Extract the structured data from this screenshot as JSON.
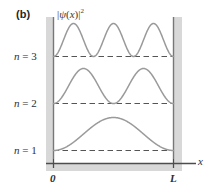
{
  "figure": {
    "panel_label": "(b)",
    "y_axis_label_parts": {
      "bar_open": "|",
      "psi": "ψ",
      "paren_open": "(",
      "var": "x",
      "paren_close": ")",
      "bar_close": "|",
      "exponent": "2"
    },
    "y_axis_label_text": "|ψ(x)|²",
    "x_axis_name": "x",
    "x_ticks": [
      {
        "label": "0",
        "value": 0
      },
      {
        "label": "L",
        "value": 1
      }
    ],
    "levels": [
      {
        "label_var": "n",
        "label_eq": " = ",
        "label_n": "3",
        "n": 3,
        "baseline_frac": 0.0
      },
      {
        "label_var": "n",
        "label_eq": " = ",
        "label_n": "2",
        "n": 2,
        "baseline_frac": 0.0
      },
      {
        "label_var": "n",
        "label_eq": " = ",
        "label_n": "1",
        "n": 1,
        "baseline_frac": 0.0
      }
    ],
    "colors": {
      "curve": "#9a9a9a",
      "dashed_baseline": "#555555",
      "wall_band": "#d8d8d8",
      "wall_line": "#777777",
      "axis_line": "#4d4d4d",
      "text": "#2e2e2e",
      "background": "#ffffff"
    }
  },
  "chart_data": {
    "type": "line",
    "title": "",
    "subtitle": "",
    "panel": "(b)",
    "xlabel": "x",
    "ylabel": "|ψ(x)|²",
    "xlim": [
      0,
      1
    ],
    "xtick_labels": [
      "0",
      "L"
    ],
    "xtick_values": [
      0,
      1
    ],
    "grid": false,
    "legend": "none",
    "annotations": [
      "n = 3",
      "n = 2",
      "n = 1"
    ],
    "series": [
      {
        "name": "n = 3",
        "n": 3,
        "baseline_y": 3,
        "peak_count": 3,
        "nodes_interior": 2,
        "formula": "|psi_3|^2 = (2/L) sin^2(3 pi x / L)",
        "x": [
          0,
          0.0556,
          0.1111,
          0.1667,
          0.2222,
          0.2778,
          0.3333,
          0.3889,
          0.4444,
          0.5,
          0.5556,
          0.6111,
          0.6667,
          0.7222,
          0.7778,
          0.8333,
          0.8889,
          0.9444,
          1
        ],
        "y": [
          0,
          0.25,
          0.75,
          1,
          0.75,
          0.25,
          0,
          0.25,
          0.75,
          1,
          0.75,
          0.25,
          0,
          0.25,
          0.75,
          1,
          0.75,
          0.25,
          0
        ]
      },
      {
        "name": "n = 2",
        "n": 2,
        "baseline_y": 2,
        "peak_count": 2,
        "nodes_interior": 1,
        "formula": "|psi_2|^2 = (2/L) sin^2(2 pi x / L)",
        "x": [
          0,
          0.0625,
          0.125,
          0.1875,
          0.25,
          0.3125,
          0.375,
          0.4375,
          0.5,
          0.5625,
          0.625,
          0.6875,
          0.75,
          0.8125,
          0.875,
          0.9375,
          1
        ],
        "y": [
          0,
          0.146,
          0.5,
          0.854,
          1,
          0.854,
          0.5,
          0.146,
          0,
          0.146,
          0.5,
          0.854,
          1,
          0.854,
          0.5,
          0.146,
          0
        ]
      },
      {
        "name": "n = 1",
        "n": 1,
        "baseline_y": 1,
        "peak_count": 1,
        "nodes_interior": 0,
        "formula": "|psi_1|^2 = (2/L) sin^2(pi x / L)",
        "x": [
          0,
          0.0625,
          0.125,
          0.1875,
          0.25,
          0.3125,
          0.375,
          0.4375,
          0.5,
          0.5625,
          0.625,
          0.6875,
          0.75,
          0.8125,
          0.875,
          0.9375,
          1
        ],
        "y": [
          0,
          0.038,
          0.146,
          0.309,
          0.5,
          0.691,
          0.854,
          0.962,
          1,
          0.962,
          0.854,
          0.691,
          0.5,
          0.309,
          0.146,
          0.038,
          0
        ]
      }
    ]
  }
}
